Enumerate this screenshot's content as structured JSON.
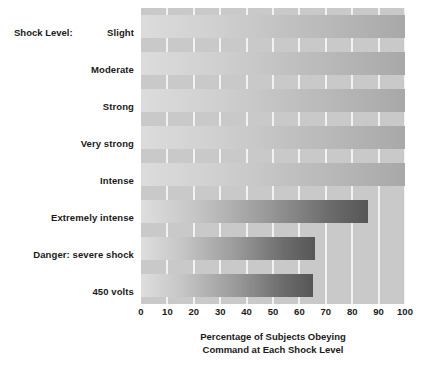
{
  "chart_data": {
    "type": "bar",
    "orientation": "horizontal",
    "title": "",
    "xlabel": "Percentage of Subjects Obeying Command at Each Shock Level",
    "xlabel_line1": "Percentage of Subjects Obeying",
    "xlabel_line2": "Command at Each Shock Level",
    "ylabel": "Shock Level:",
    "categories": [
      "Slight",
      "Moderate",
      "Strong",
      "Very strong",
      "Intense",
      "Extremely intense",
      "Danger: severe shock",
      "450 volts"
    ],
    "values": [
      100,
      100,
      100,
      100,
      100,
      86,
      66,
      65
    ],
    "xlim": [
      0,
      100
    ],
    "xticks": [
      0,
      10,
      20,
      30,
      40,
      50,
      60,
      70,
      80,
      90,
      100
    ],
    "xtick_labels": [
      "0",
      "10",
      "20",
      "30",
      "40",
      "50",
      "60",
      "70",
      "80",
      "90",
      "100"
    ],
    "grid": true,
    "grid_axis": "x",
    "legend": false,
    "colors": {
      "plot_background": "#c9c9c9",
      "gridline": "#f2f2f2",
      "bar_light": "#dedede",
      "bar_dark": "#565656",
      "text": "#1a1a1a",
      "page_background": "#ffffff"
    }
  }
}
